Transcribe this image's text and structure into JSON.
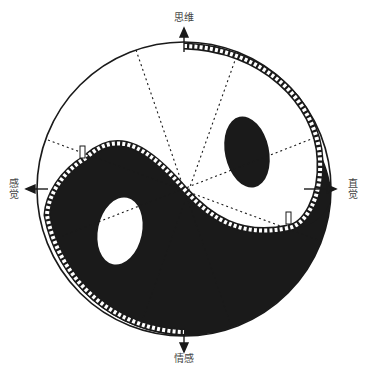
{
  "diagram": {
    "type": "yin-yang function diagram",
    "center": [
      184,
      189
    ],
    "radius": 147,
    "colors": {
      "background": "#ffffff",
      "ink": "#1a1a1a",
      "light": "#ffffff"
    },
    "labels": {
      "top": "思维",
      "bottom": "情感",
      "left": "感觉",
      "right": "直觉"
    },
    "arrows": [
      "up",
      "down",
      "left",
      "right"
    ],
    "dotted_lines": 4,
    "band": "film-strip boundary along S-curve and outer arc"
  }
}
